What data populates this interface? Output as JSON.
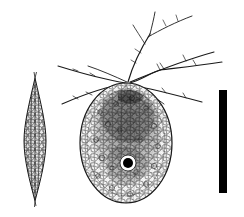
{
  "figure": {
    "background_color": "#ffffff",
    "ink_color": "#1a1a1a",
    "width_px": 244,
    "height_px": 217,
    "panels": [
      {
        "id": "lateral-view",
        "label": "lateral (narrow) view",
        "shape": "spindle",
        "center_x": 35,
        "center_y": 139,
        "half_width": 11,
        "top_y": 78,
        "bottom_y": 201,
        "texture": "granular scales",
        "has_median_suture": true
      },
      {
        "id": "broad-view",
        "label": "broad (face) view",
        "shape": "oval",
        "center_x": 126,
        "center_y": 143,
        "radius_x": 46,
        "radius_y": 60,
        "texture": "granular scales",
        "aperture": {
          "label": "aperture / pore",
          "center_x": 128,
          "center_y": 163,
          "outer_radius": 8,
          "inner_radius": 5,
          "inner_color": "#000000",
          "ring_color": "#ffffff"
        },
        "spines": {
          "label": "apical spines",
          "origin_x": 128,
          "origin_y": 83,
          "count": 8,
          "branched": true
        }
      }
    ],
    "scale_bar": {
      "label": "scale bar",
      "x": 219,
      "y": 90,
      "width": 8,
      "height": 103,
      "color": "#000000",
      "orientation": "vertical"
    }
  }
}
